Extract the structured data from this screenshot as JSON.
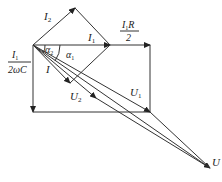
{
  "diagram": {
    "colors": {
      "stroke": "#333333",
      "background": "#ffffff"
    },
    "labels": {
      "I2": "I",
      "I2_sub": "2",
      "I1": "I",
      "I1_sub": "1",
      "I1R_num": "I",
      "I1R_num_sub": "1",
      "I1R_num_tail": "R",
      "I1R_den": "2",
      "cap_num": "I",
      "cap_num_sub": "1",
      "cap_den": "2ωC",
      "alpha2": "α",
      "alpha2_sub": "2",
      "alpha1": "α",
      "alpha1_sub": "1",
      "I": "I",
      "U2": "U",
      "U2_sub": "2",
      "U1": "U",
      "U1_sub": "1",
      "U": "U"
    },
    "vectors": [
      {
        "name": "I2",
        "from": [
          33,
          45
        ],
        "to": [
          75,
          8
        ]
      },
      {
        "name": "I1",
        "from": [
          33,
          45
        ],
        "to": [
          110,
          45
        ]
      },
      {
        "name": "I1R/2",
        "from": [
          110,
          45
        ],
        "to": [
          150,
          45
        ]
      },
      {
        "name": "I1/(2wC)",
        "from": [
          33,
          45
        ],
        "to": [
          33,
          112
        ]
      },
      {
        "name": "I",
        "from": [
          33,
          45
        ],
        "to": [
          70,
          83
        ]
      },
      {
        "name": "U2",
        "from": [
          33,
          45
        ],
        "to": [
          96,
          98
        ]
      },
      {
        "name": "U1",
        "from": [
          33,
          45
        ],
        "to": [
          150,
          112
        ]
      },
      {
        "name": "U",
        "from": [
          33,
          45
        ],
        "to": [
          210,
          168
        ]
      }
    ]
  }
}
